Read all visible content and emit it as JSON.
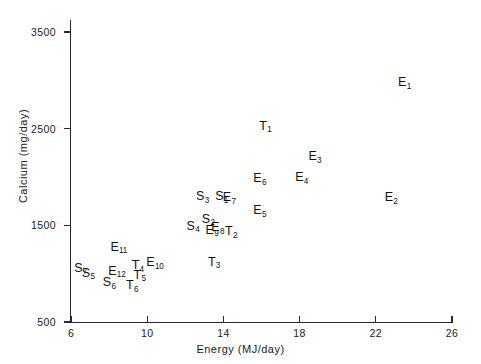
{
  "chart_data": {
    "type": "scatter",
    "title": "",
    "xlabel": "Energy (MJ/day)",
    "ylabel": "Calcium (mg/day)",
    "xlim": [
      6,
      26
    ],
    "ylim": [
      500,
      3500
    ],
    "xticks": [
      "6",
      "10",
      "14",
      "18",
      "22",
      "26"
    ],
    "yticks": [
      "500",
      "1500",
      "2500",
      "3500"
    ],
    "grid": false,
    "legend": "none",
    "point_label_style": "letter-with-subscript",
    "points": [
      {
        "label": "E1",
        "letter": "E",
        "sub": "1",
        "x": 23.5,
        "y": 2980
      },
      {
        "label": "E2",
        "letter": "E",
        "sub": "2",
        "x": 22.8,
        "y": 1790
      },
      {
        "label": "E3",
        "letter": "E",
        "sub": "3",
        "x": 18.8,
        "y": 2215
      },
      {
        "label": "E4",
        "letter": "E",
        "sub": "4",
        "x": 18.1,
        "y": 2000
      },
      {
        "label": "E5",
        "letter": "E",
        "sub": "5",
        "x": 15.9,
        "y": 1655
      },
      {
        "label": "E6",
        "letter": "E",
        "sub": "6",
        "x": 15.9,
        "y": 1985
      },
      {
        "label": "E7",
        "letter": "E",
        "sub": "7",
        "x": 14.3,
        "y": 1790
      },
      {
        "label": "E8",
        "letter": "E",
        "sub": "8",
        "x": 13.7,
        "y": 1480
      },
      {
        "label": "E9",
        "letter": "E",
        "sub": "9",
        "x": 13.4,
        "y": 1455
      },
      {
        "label": "E10",
        "letter": "E",
        "sub": "10",
        "x": 10.4,
        "y": 1120
      },
      {
        "label": "E11",
        "letter": "E",
        "sub": "11",
        "x": 8.5,
        "y": 1280
      },
      {
        "label": "E12",
        "letter": "E",
        "sub": "12",
        "x": 8.4,
        "y": 1030
      },
      {
        "label": "S1",
        "letter": "S",
        "sub": "1",
        "x": 13.9,
        "y": 1800
      },
      {
        "label": "S2",
        "letter": "S",
        "sub": "2",
        "x": 13.2,
        "y": 1570
      },
      {
        "label": "S3",
        "letter": "S",
        "sub": "3",
        "x": 12.9,
        "y": 1800
      },
      {
        "label": "S4",
        "letter": "S",
        "sub": "4",
        "x": 12.4,
        "y": 1495
      },
      {
        "label": "S5",
        "letter": "S",
        "sub": "5",
        "x": 6.9,
        "y": 1010
      },
      {
        "label": "S6",
        "letter": "S",
        "sub": "6",
        "x": 8.0,
        "y": 910
      },
      {
        "label": "S7",
        "letter": "S",
        "sub": "7",
        "x": 6.5,
        "y": 1060
      },
      {
        "label": "T1",
        "letter": "T",
        "sub": "1",
        "x": 16.2,
        "y": 2530
      },
      {
        "label": "T2",
        "letter": "T",
        "sub": "2",
        "x": 14.4,
        "y": 1440
      },
      {
        "label": "T3",
        "letter": "T",
        "sub": "3",
        "x": 13.5,
        "y": 1125
      },
      {
        "label": "T4",
        "letter": "T",
        "sub": "4",
        "x": 9.5,
        "y": 1085
      },
      {
        "label": "T5",
        "letter": "T",
        "sub": "5",
        "x": 9.6,
        "y": 990
      },
      {
        "label": "T6",
        "letter": "T",
        "sub": "6",
        "x": 9.2,
        "y": 880
      }
    ]
  }
}
